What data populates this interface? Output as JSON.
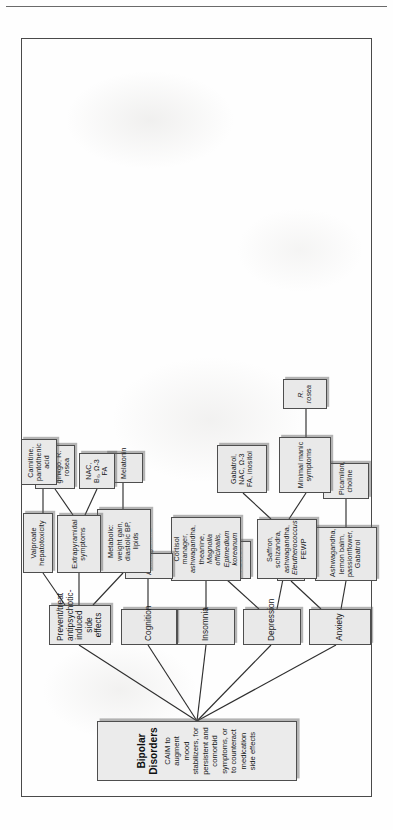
{
  "page": {
    "orientation": "rotated-90-counterclockwise",
    "border_color": "#4a4a4a",
    "node_fill": "#e9e9e9"
  },
  "title": {
    "heading": "Bipolar Disorders",
    "subtitle": "CAIM to augment mood stabilizers, for persistent and comorbid symptoms, or to counteract medication side effects"
  },
  "branches": [
    {
      "id": "anxiety",
      "label": "Anxiety",
      "children": [
        {
          "id": "anx-ces",
          "label": "CES",
          "children": []
        },
        {
          "id": "anx-herbs",
          "label": "Ashwagandha, lemon balm, passionflower, Gabatrol",
          "children": [
            {
              "id": "anx-picamilon",
              "label": "Picamilon, choline",
              "children": []
            }
          ]
        }
      ]
    },
    {
      "id": "depression",
      "label": "Depression",
      "children": [
        {
          "id": "dep-ces",
          "label": "CES, light therapy, ALCAR",
          "children": []
        },
        {
          "id": "dep-herbs",
          "label": "Saffron, schizandra, ashwagandha, Eleutherococcus, FEWP",
          "label_parts": [
            {
              "text": "Saffron, schizandra, ashwagandha, ",
              "italic": false
            },
            {
              "text": "Eleutherococcus",
              "italic": true
            },
            {
              "text": ", FEWP",
              "italic": false
            }
          ],
          "children": [
            {
              "id": "dep-gabatrol",
              "label": "Gabatrol, NAC, Ω-3 FA, inositol",
              "children": []
            },
            {
              "id": "dep-minimal-manic",
              "label": "Minimal manic symptoms",
              "children": [
                {
                  "id": "dep-rrosea",
                  "label": "R. rosea",
                  "italic": true,
                  "children": []
                }
              ]
            }
          ]
        }
      ]
    },
    {
      "id": "insomnia",
      "label": "Insomnia",
      "children": [
        {
          "id": "ins-cortisol",
          "label": "Cortisol manager, ashwagandha, theanine, Magnolia officinalis, Epimedium koreanum",
          "label_parts": [
            {
              "text": "Cortisol manager, ashwagandha, theanine, ",
              "italic": false
            },
            {
              "text": "Magnolia officinalis, Epimedium koreanum",
              "italic": true
            }
          ],
          "children": []
        }
      ]
    },
    {
      "id": "cognition",
      "label": "Cognition",
      "children": [
        {
          "id": "cog-ashwagandha",
          "label": "Ashwagandha",
          "children": []
        }
      ]
    },
    {
      "id": "side-effects",
      "label": "Prevent/treat antipsychotic-induced side effects",
      "children": [
        {
          "id": "se-metabolic",
          "label": "Metabolic: weight gain, diastolic BP, lipids",
          "children": [
            {
              "id": "se-melatonin",
              "label": "Melatonin",
              "children": []
            }
          ]
        },
        {
          "id": "se-eps",
          "label": "Extrapyramidal symptoms",
          "children": [
            {
              "id": "se-nac",
              "label": "NAC, B₆, Ω-3 FA",
              "children": []
            },
            {
              "id": "se-melatonin2",
              "label": "Melatonin, DHEA, ginkgo, R. rosea",
              "children": []
            }
          ]
        },
        {
          "id": "se-valproate",
          "label": "Valproate hepatotoxicity",
          "children": [
            {
              "id": "se-carnitine",
              "label": "Carnitine, pantothenic acid",
              "children": []
            }
          ]
        }
      ]
    }
  ]
}
